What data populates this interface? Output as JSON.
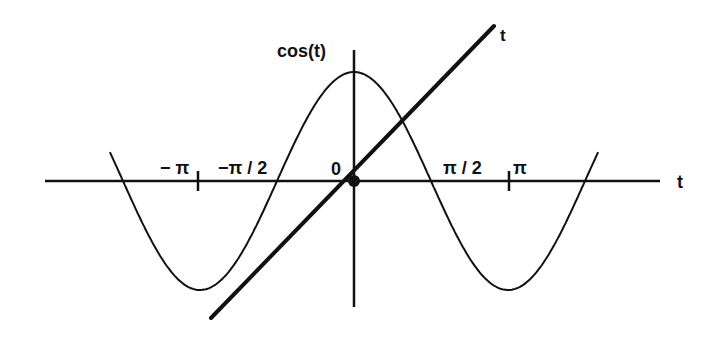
{
  "diagram": {
    "colors": {
      "ink": "#111111",
      "background": "#ffffff"
    },
    "axes": {
      "horizontal_label": "t",
      "vertical_label": "cos(t)",
      "origin_label": "0"
    },
    "ticks": [
      {
        "label": "−π",
        "value": -3.14159
      },
      {
        "label": "−π/2",
        "value": -1.5708
      },
      {
        "label": "π/2",
        "value": 1.5708
      },
      {
        "label": "π",
        "value": 3.14159
      }
    ],
    "curves": [
      {
        "name": "cos(t)",
        "t_range": [
          -4.98,
          4.98
        ]
      },
      {
        "name": "t",
        "label": "t"
      }
    ]
  },
  "labels": {
    "cos": "cos(t)",
    "t_axis": "t",
    "t_line": "t",
    "zero": "0",
    "neg_pi": "− π",
    "neg_pi_half": "−π / 2",
    "pi_half": "π / 2",
    "pi": "π"
  }
}
